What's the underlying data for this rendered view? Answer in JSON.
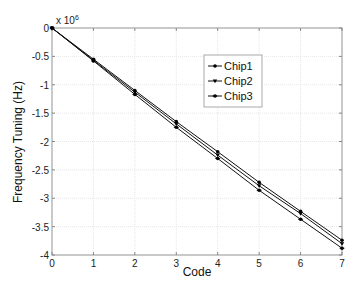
{
  "chart_data": {
    "type": "line",
    "title": "",
    "xlabel": "Code",
    "ylabel": "Frequency Tuning (Hz)",
    "y_multiplier_label": "x 10",
    "y_multiplier_exponent": "6",
    "x": [
      0,
      1,
      2,
      3,
      4,
      5,
      6,
      7
    ],
    "series": [
      {
        "name": "Chip1",
        "marker": "dot",
        "values": [
          0,
          -0.55,
          -1.1,
          -1.65,
          -2.18,
          -2.72,
          -3.23,
          -3.74
        ]
      },
      {
        "name": "Chip2",
        "marker": "triangle-down",
        "values": [
          0,
          -0.57,
          -1.13,
          -1.69,
          -2.24,
          -2.78,
          -3.27,
          -3.8
        ]
      },
      {
        "name": "Chip3",
        "marker": "star",
        "values": [
          0,
          -0.58,
          -1.17,
          -1.75,
          -2.3,
          -2.86,
          -3.37,
          -3.88
        ]
      }
    ],
    "xlim": [
      0,
      7
    ],
    "ylim": [
      -4,
      0
    ],
    "xticks": [
      "0",
      "1",
      "2",
      "3",
      "4",
      "5",
      "6",
      "7"
    ],
    "yticks": [
      "0",
      "-0.5",
      "-1",
      "-1.5",
      "-2",
      "-2.5",
      "-3",
      "-3.5",
      "-4"
    ],
    "grid": true,
    "legend_position": "upper right (inside)"
  }
}
